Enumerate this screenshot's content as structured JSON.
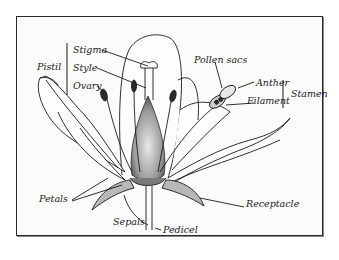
{
  "diagram": {
    "groups": [
      {
        "name": "Pistil",
        "parts": [
          "Stigma",
          "Style",
          "Ovary"
        ]
      },
      {
        "name": "Stamen",
        "parts": [
          "Anther",
          "Filament"
        ]
      }
    ],
    "labels": {
      "pistil": "Pistil",
      "stigma": "Stigma",
      "style": "Style",
      "ovary": "Ovary",
      "pollen_sacs": "Pollen sacs",
      "anther": "Anther",
      "filament": "Filament",
      "stamen": "Stamen",
      "petals": "Petals",
      "receptacle": "Receptacle",
      "sepals": "Sepals",
      "pedicel": "Pedicel"
    },
    "colors": {
      "ink": "#1a1a1a",
      "frame_border": "#2a2a2a",
      "background": "#fbfbfa"
    }
  }
}
